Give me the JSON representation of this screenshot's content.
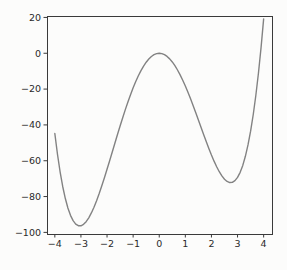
{
  "figure": {
    "background_color": "#fcfcfb"
  },
  "chart_data": {
    "type": "line",
    "grid": false,
    "legend": null,
    "xlim": [
      -4.3,
      4.32
    ],
    "ylim": [
      -100.9,
      20.8
    ],
    "xticks": [
      -4,
      -3,
      -2,
      -1,
      0,
      1,
      2,
      3,
      4
    ],
    "yticks": [
      20,
      0,
      -20,
      -40,
      -60,
      -80,
      -100
    ],
    "line_color": "#828282",
    "axis_color": "#3a3a3a",
    "tick_label_color": "#2a2a2a",
    "series": [
      {
        "name": "curve",
        "x": [
          -4.0,
          -3.9,
          -3.8,
          -3.7,
          -3.6,
          -3.5,
          -3.4,
          -3.3,
          -3.2,
          -3.1,
          -3.0,
          -2.9,
          -2.8,
          -2.7,
          -2.6,
          -2.5,
          -2.4,
          -2.3,
          -2.2,
          -2.1,
          -2.0,
          -1.9,
          -1.8,
          -1.7,
          -1.6,
          -1.5,
          -1.4,
          -1.3,
          -1.2,
          -1.1,
          -1.0,
          -0.9,
          -0.8,
          -0.7,
          -0.6,
          -0.5,
          -0.4,
          -0.3,
          -0.2,
          -0.1,
          0.0,
          0.1,
          0.2,
          0.3,
          0.4,
          0.5,
          0.6,
          0.7,
          0.8,
          0.9,
          1.0,
          1.1,
          1.2,
          1.3,
          1.4,
          1.5,
          1.6,
          1.7,
          1.8,
          1.9,
          2.0,
          2.1,
          2.2,
          2.3,
          2.4,
          2.5,
          2.6,
          2.7,
          2.8,
          2.9,
          3.0,
          3.1,
          3.2,
          3.3,
          3.4,
          3.5,
          3.6,
          3.7,
          3.8,
          3.9,
          4.0
        ],
        "y": [
          -44.8,
          -56.25,
          -66.02,
          -74.23,
          -80.97,
          -86.36,
          -90.49,
          -93.46,
          -95.35,
          -96.27,
          -96.3,
          -95.52,
          -94.02,
          -91.87,
          -89.15,
          -85.94,
          -82.3,
          -78.3,
          -74.01,
          -69.49,
          -64.8,
          -59.99,
          -55.12,
          -50.23,
          -45.38,
          -40.61,
          -35.96,
          -31.47,
          -27.18,
          -23.11,
          -19.3,
          -15.78,
          -12.56,
          -9.68,
          -7.15,
          -4.99,
          -3.2,
          -1.8,
          -0.8,
          -0.2,
          0.0,
          -0.2,
          -0.79,
          -1.78,
          -3.14,
          -4.86,
          -6.94,
          -9.34,
          -12.05,
          -15.05,
          -18.3,
          -21.78,
          -25.45,
          -29.27,
          -33.22,
          -37.24,
          -41.29,
          -45.32,
          -49.29,
          -53.13,
          -56.8,
          -60.23,
          -63.37,
          -66.14,
          -68.47,
          -70.31,
          -71.57,
          -72.19,
          -72.07,
          -71.13,
          -69.3,
          -66.48,
          -62.59,
          -57.52,
          -51.19,
          -43.49,
          -34.32,
          -23.57,
          -11.15,
          3.07,
          19.2
        ]
      }
    ]
  }
}
